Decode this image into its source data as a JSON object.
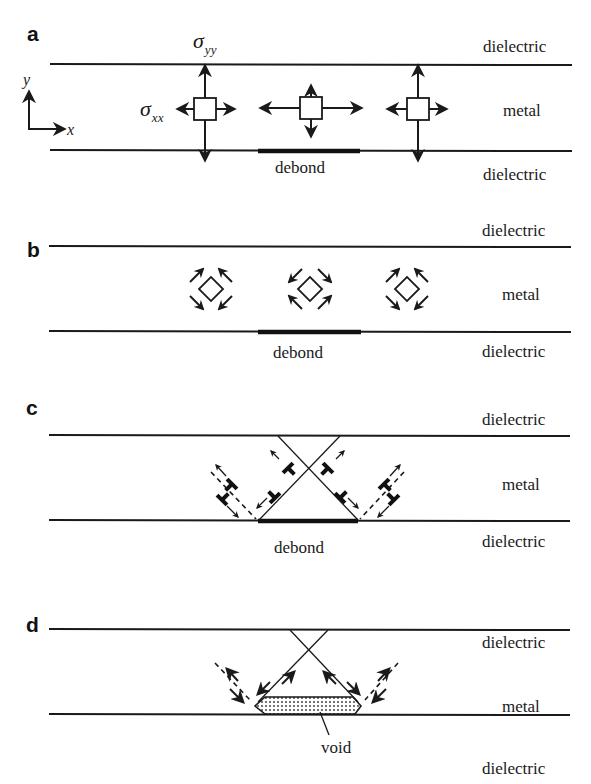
{
  "figure": {
    "panels": [
      {
        "id": "a",
        "label": "a",
        "top_layer": "dielectric",
        "middle_layer": "metal",
        "bottom_layer": "dielectric",
        "debond_label": "debond",
        "stress_labels": {
          "sigma_yy": "σ",
          "sigma_yy_sub": "yy",
          "sigma_xx": "σ",
          "sigma_xx_sub": "xx"
        },
        "axes": {
          "x": "x",
          "y": "y"
        },
        "description": "Stress elements: biaxial tension in metal line; element above debond has reduced vertical stress"
      },
      {
        "id": "b",
        "label": "b",
        "top_layer": "dielectric",
        "middle_layer": "metal",
        "bottom_layer": "dielectric",
        "debond_label": "debond",
        "description": "Rotated 45° elements showing shear stresses; sign reversed above debond"
      },
      {
        "id": "c",
        "label": "c",
        "top_layer": "dielectric",
        "middle_layer": "metal",
        "bottom_layer": "dielectric",
        "debond_label": "debond",
        "description": "Dislocations glide on crossing slip planes toward the debond"
      },
      {
        "id": "d",
        "label": "d",
        "top_layer": "dielectric",
        "middle_layer": "metal",
        "bottom_layer": "dielectric",
        "void_label": "void",
        "description": "Void nucleates at debond region bounded by slip planes"
      }
    ],
    "colors": {
      "ink": "#1a1a1a",
      "background": "#ffffff"
    }
  }
}
